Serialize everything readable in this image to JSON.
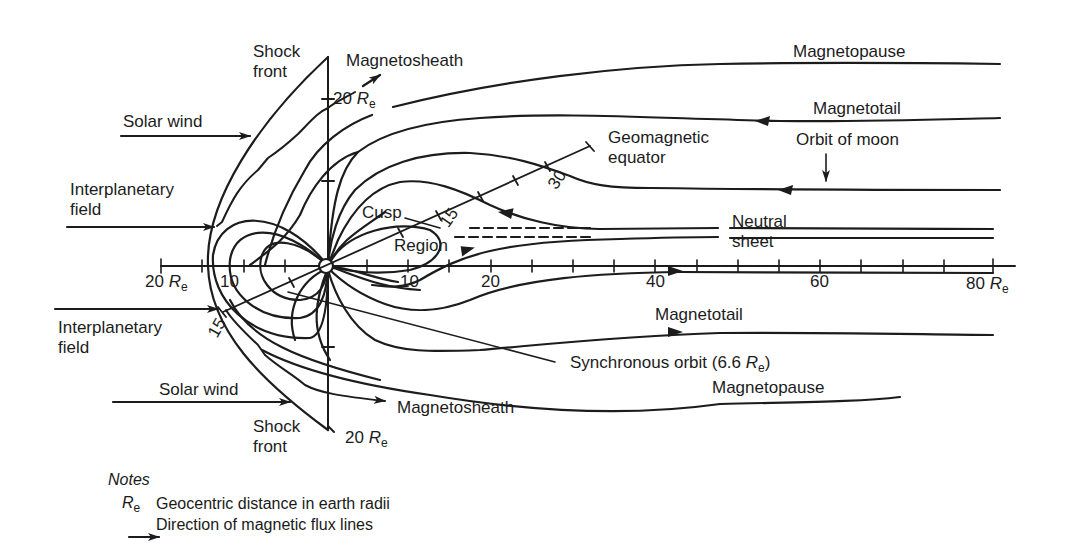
{
  "diagram": {
    "type": "magnetosphere cross-section",
    "labels": {
      "shock_front_top": [
        "Shock",
        "front"
      ],
      "shock_front_bottom": [
        "Shock",
        "front"
      ],
      "magnetosheath_top": "Magnetosheath",
      "magnetosheath_bottom": "Magnetosheath",
      "magnetopause_top": "Magnetopause",
      "magnetopause_bottom": "Magnetopause",
      "magnetotail_top": "Magnetotail",
      "magnetotail_bottom": "Magnetotail",
      "orbit_of_moon": "Orbit of moon",
      "geomagnetic_equator": [
        "Geomagnetic",
        "equator"
      ],
      "solar_wind_top": "Solar wind",
      "solar_wind_bottom": "Solar wind",
      "interplanetary_field_top": [
        "Interplanetary",
        "field"
      ],
      "interplanetary_field_bottom": [
        "Interplanetary",
        "field"
      ],
      "cusp": "Cusp",
      "region": "Region",
      "neutral_sheet": [
        "Neutral",
        "sheet"
      ],
      "synchronous_orbit_prefix": "Synchronous orbit (6.6 ",
      "synchronous_orbit_suffix": ")",
      "vertical_top_distance": "20 ",
      "vertical_bottom_distance": "20 ",
      "unit_R": "R",
      "unit_sub": "e"
    },
    "axis": {
      "left_labels": [
        {
          "text": "20 ",
          "unit": true
        },
        {
          "text": "10",
          "unit": false
        }
      ],
      "right_labels": [
        "10",
        "20",
        "40",
        "60"
      ],
      "end_label": "80 ",
      "equator_ticks": [
        "15",
        "30"
      ],
      "lower_equator_tick": "15"
    }
  },
  "notes": {
    "title": "Notes",
    "items": [
      {
        "symbol": "R_e",
        "text": "Geocentric distance in earth radii"
      },
      {
        "symbol": "arrow",
        "text": "Direction of magnetic flux lines"
      }
    ]
  }
}
